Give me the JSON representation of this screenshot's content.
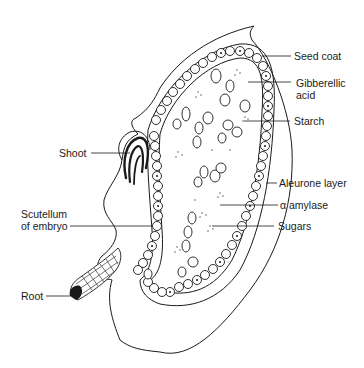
{
  "diagram": {
    "labels": {
      "seed_coat": "Seed coat",
      "gibberellic_1": "Gibberellic",
      "gibberellic_2": "acid",
      "starch": "Starch",
      "aleurone": "Aleurone layer",
      "amylase": "α amylase",
      "sugars": "Sugars",
      "shoot": "Shoot",
      "scutellum_1": "Scutellum",
      "scutellum_2": "of embryo",
      "root": "Root"
    },
    "colors": {
      "line": "#1a1a1a",
      "background": "#ffffff"
    }
  }
}
